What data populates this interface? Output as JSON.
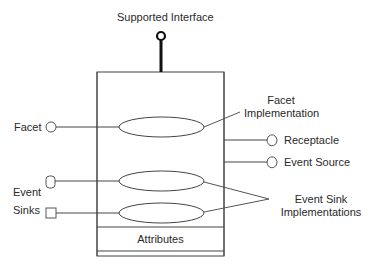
{
  "diagram": {
    "labels": {
      "supported_interface": "Supported Interface",
      "facet": "Facet",
      "facet_impl_line1": "Facet",
      "facet_impl_line2": "Implementation",
      "receptacle": "Receptacle",
      "event_source": "Event Source",
      "event_sinks_line1": "Event",
      "event_sinks_line2": "Sinks",
      "event_sink_impl_line1": "Event Sink",
      "event_sink_impl_line2": "Implementations",
      "attributes": "Attributes"
    },
    "colors": {
      "stroke": "#333333",
      "lollipop": "#111111",
      "background": "#ffffff"
    },
    "nodes": [
      {
        "id": "component",
        "type": "rectangle"
      },
      {
        "id": "supported-interface",
        "type": "lollipop"
      },
      {
        "id": "facet",
        "type": "port-circle"
      },
      {
        "id": "facet-implementation",
        "type": "ellipse"
      },
      {
        "id": "receptacle",
        "type": "port-cup"
      },
      {
        "id": "event-source",
        "type": "port-cup"
      },
      {
        "id": "event-sink-1",
        "type": "port-rounded"
      },
      {
        "id": "event-sink-2",
        "type": "port-square"
      },
      {
        "id": "event-sink-impl-1",
        "type": "ellipse"
      },
      {
        "id": "event-sink-impl-2",
        "type": "ellipse"
      },
      {
        "id": "attributes",
        "type": "compartment"
      }
    ],
    "edges": [
      {
        "from": "facet",
        "to": "facet-implementation"
      },
      {
        "from": "event-sink-1",
        "to": "event-sink-impl-1"
      },
      {
        "from": "event-sink-2",
        "to": "event-sink-impl-2"
      },
      {
        "from": "component",
        "to": "receptacle"
      },
      {
        "from": "component",
        "to": "event-source"
      },
      {
        "from": "component",
        "to": "supported-interface"
      }
    ]
  }
}
